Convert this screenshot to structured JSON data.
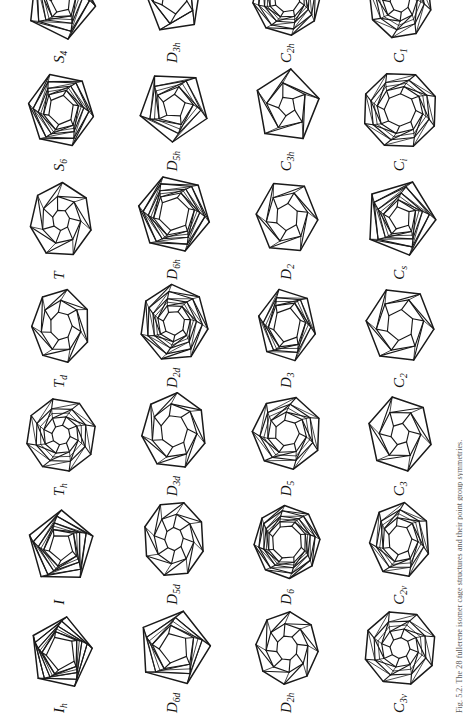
{
  "figure": {
    "orientation": "rotated-90-ccw",
    "rows": 4,
    "columns": 7,
    "ink_color": "#1a1a1a",
    "background_color": "#ffffff",
    "caption": "Fig. 5.2. The 28 fullerene isomer cage structures and their point group symmetries."
  },
  "cells": [
    {
      "label_main": "I",
      "label_sub": "h",
      "name": "cage-Ih",
      "row": 1,
      "col": 1
    },
    {
      "label_main": "I",
      "label_sub": "",
      "name": "cage-I",
      "row": 1,
      "col": 2
    },
    {
      "label_main": "T",
      "label_sub": "h",
      "name": "cage-Th",
      "row": 1,
      "col": 3
    },
    {
      "label_main": "T",
      "label_sub": "d",
      "name": "cage-Td",
      "row": 1,
      "col": 4
    },
    {
      "label_main": "T",
      "label_sub": "",
      "name": "cage-T",
      "row": 1,
      "col": 5
    },
    {
      "label_main": "S",
      "label_sub": "6",
      "name": "cage-S6",
      "row": 1,
      "col": 6
    },
    {
      "label_main": "S",
      "label_sub": "4",
      "name": "cage-S4",
      "row": 1,
      "col": 7
    },
    {
      "label_main": "D",
      "label_sub": "6d",
      "name": "cage-D6d",
      "row": 2,
      "col": 1
    },
    {
      "label_main": "D",
      "label_sub": "5d",
      "name": "cage-D5d",
      "row": 2,
      "col": 2
    },
    {
      "label_main": "D",
      "label_sub": "3d",
      "name": "cage-D3d",
      "row": 2,
      "col": 3
    },
    {
      "label_main": "D",
      "label_sub": "2d",
      "name": "cage-D2d",
      "row": 2,
      "col": 4
    },
    {
      "label_main": "D",
      "label_sub": "6h",
      "name": "cage-D6h",
      "row": 2,
      "col": 5
    },
    {
      "label_main": "D",
      "label_sub": "5h",
      "name": "cage-D5h",
      "row": 2,
      "col": 6
    },
    {
      "label_main": "D",
      "label_sub": "3h",
      "name": "cage-D3h",
      "row": 2,
      "col": 7
    },
    {
      "label_main": "D",
      "label_sub": "2h",
      "name": "cage-D2h",
      "row": 3,
      "col": 1
    },
    {
      "label_main": "D",
      "label_sub": "6",
      "name": "cage-D6",
      "row": 3,
      "col": 2
    },
    {
      "label_main": "D",
      "label_sub": "5",
      "name": "cage-D5",
      "row": 3,
      "col": 3
    },
    {
      "label_main": "D",
      "label_sub": "3",
      "name": "cage-D3",
      "row": 3,
      "col": 4
    },
    {
      "label_main": "D",
      "label_sub": "2",
      "name": "cage-D2",
      "row": 3,
      "col": 5
    },
    {
      "label_main": "C",
      "label_sub": "3h",
      "name": "cage-C3h",
      "row": 3,
      "col": 6
    },
    {
      "label_main": "C",
      "label_sub": "2h",
      "name": "cage-C2h",
      "row": 3,
      "col": 7
    },
    {
      "label_main": "C",
      "label_sub": "3v",
      "name": "cage-C3v",
      "row": 4,
      "col": 1
    },
    {
      "label_main": "C",
      "label_sub": "2v",
      "name": "cage-C2v",
      "row": 4,
      "col": 2
    },
    {
      "label_main": "C",
      "label_sub": "3",
      "name": "cage-C3",
      "row": 4,
      "col": 3
    },
    {
      "label_main": "C",
      "label_sub": "2",
      "name": "cage-C2",
      "row": 4,
      "col": 4
    },
    {
      "label_main": "C",
      "label_sub": "s",
      "name": "cage-Cs",
      "row": 4,
      "col": 5
    },
    {
      "label_main": "C",
      "label_sub": "i",
      "name": "cage-Ci",
      "row": 4,
      "col": 6
    },
    {
      "label_main": "C",
      "label_sub": "1",
      "name": "cage-C1",
      "row": 4,
      "col": 7
    }
  ]
}
